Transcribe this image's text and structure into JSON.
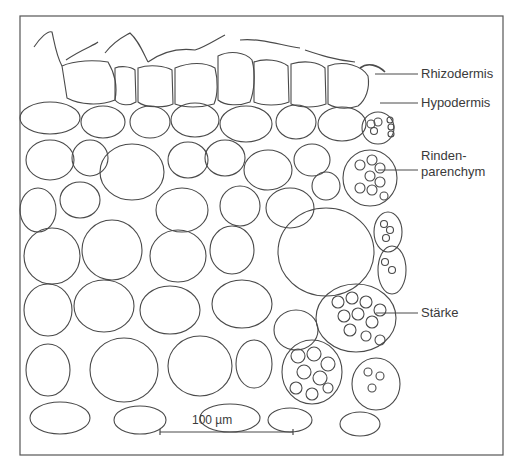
{
  "figure": {
    "line_color": "#4a4a4a",
    "background": "#ffffff",
    "frame": {
      "x": 20,
      "y": 16,
      "width": 483,
      "height": 439
    }
  },
  "labels": [
    {
      "id": "rhizodermis",
      "text": "Rhizodermis",
      "y": 74
    },
    {
      "id": "hypodermis",
      "text": "Hypodermis",
      "y": 103
    },
    {
      "id": "rindenparenchym",
      "text_line1": "Rinden-",
      "text_line2": "parenchym",
      "y": 170
    },
    {
      "id": "staerke",
      "text": "Stärke",
      "y": 313
    }
  ],
  "scale_bar": {
    "label": "100 µm",
    "x1": 160,
    "x2": 293,
    "y": 432
  }
}
